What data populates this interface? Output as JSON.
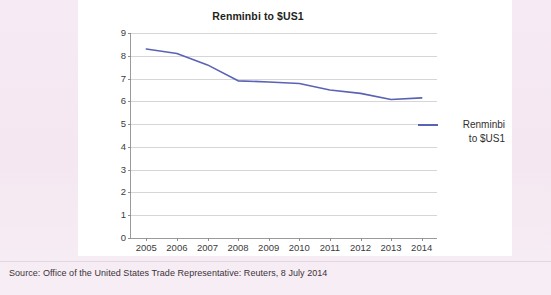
{
  "chart_card": {
    "title": "Renminbi to $US1"
  },
  "legend": {
    "entries": [
      {
        "label_line1": "Renminbi",
        "label_line2": "to $US1",
        "color": "#5a62b4"
      }
    ]
  },
  "footer": {
    "source": "Source: Office of the United States Trade Representative: Reuters, 8 July 2014"
  },
  "colors": {
    "page_background": "#f4e7f1",
    "card_background": "#ffffff",
    "series_line": "#5a62b4",
    "gridline": "#d6d6d6",
    "axis": "#9a9a9a",
    "text": "#231f20"
  },
  "chart_data": {
    "type": "line",
    "title": "Renminbi to $US1",
    "xlabel": "",
    "ylabel": "",
    "categories": [
      "2005",
      "2006",
      "2007",
      "2008",
      "2009",
      "2010",
      "2011",
      "2012",
      "2013",
      "2014"
    ],
    "x": [
      2005,
      2006,
      2007,
      2008,
      2009,
      2010,
      2011,
      2012,
      2013,
      2014
    ],
    "series": [
      {
        "name": "Renminbi to $US1",
        "color": "#5a62b4",
        "values": [
          8.3,
          8.1,
          7.6,
          6.9,
          6.85,
          6.78,
          6.5,
          6.35,
          6.08,
          6.15
        ]
      }
    ],
    "ylim": [
      0,
      9
    ],
    "ytick_labels": [
      "0",
      "1",
      "2",
      "3",
      "4",
      "5",
      "6",
      "7",
      "8",
      "9"
    ],
    "yticks": [
      0,
      1,
      2,
      3,
      4,
      5,
      6,
      7,
      8,
      9
    ],
    "grid": true,
    "grid_axis": "y",
    "legend_position": "right",
    "markers": false
  }
}
